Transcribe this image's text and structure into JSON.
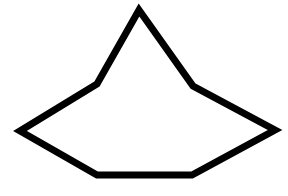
{
  "diagram": {
    "shape": "heptagon",
    "background": "#ffffff",
    "stroke_color": "#000000",
    "fill_color": "#ffffff",
    "stroke_width": 7,
    "points": [
      [
        139,
        10
      ],
      [
        193,
        86
      ],
      [
        275,
        130
      ],
      [
        192,
        175
      ],
      [
        97,
        175
      ],
      [
        20,
        131
      ],
      [
        97,
        84
      ]
    ]
  }
}
